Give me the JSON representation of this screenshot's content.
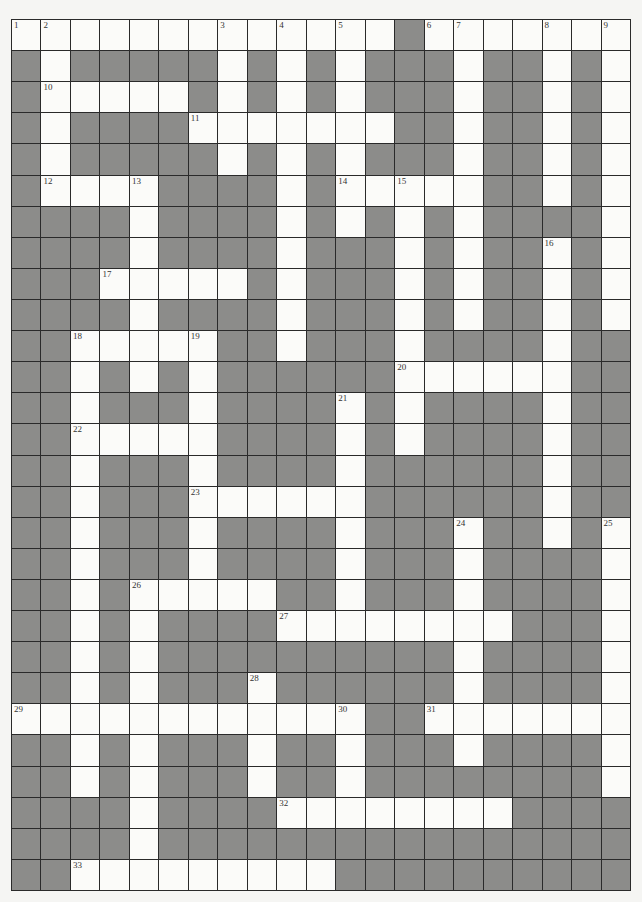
{
  "puzzle": {
    "type": "crossword",
    "cols": 21,
    "rows": 28,
    "colors": {
      "white_cell": "#fbfbf9",
      "block_cell": "#8c8c8a",
      "grid_line": "#2a2a2a",
      "background": "#f5f5f3"
    },
    "white_cells_by_row": [
      [
        0,
        1,
        2,
        3,
        4,
        5,
        6,
        7,
        8,
        9,
        10,
        11,
        12,
        14,
        15,
        16,
        17,
        18,
        19,
        20
      ],
      [
        1,
        7,
        9,
        11,
        15,
        18,
        20
      ],
      [
        1,
        2,
        3,
        4,
        5,
        7,
        9,
        11,
        15,
        18,
        20
      ],
      [
        1,
        6,
        7,
        8,
        9,
        10,
        11,
        12,
        15,
        18,
        20
      ],
      [
        1,
        7,
        9,
        11,
        15,
        18,
        20
      ],
      [
        1,
        2,
        3,
        4,
        9,
        11,
        12,
        13,
        14,
        15,
        18,
        20
      ],
      [
        4,
        9,
        11,
        13,
        15,
        20
      ],
      [
        4,
        9,
        13,
        15,
        18,
        20
      ],
      [
        3,
        4,
        5,
        6,
        7,
        9,
        13,
        15,
        18,
        20
      ],
      [
        4,
        9,
        13,
        15,
        18,
        20
      ],
      [
        2,
        3,
        4,
        5,
        6,
        9,
        13,
        18
      ],
      [
        2,
        4,
        6,
        13,
        14,
        15,
        16,
        17,
        18
      ],
      [
        2,
        6,
        11,
        13,
        18
      ],
      [
        2,
        3,
        4,
        5,
        6,
        11,
        13,
        18
      ],
      [
        2,
        6,
        11,
        18
      ],
      [
        2,
        6,
        7,
        8,
        9,
        10,
        11,
        18
      ],
      [
        2,
        6,
        11,
        15,
        18,
        20
      ],
      [
        2,
        6,
        11,
        15,
        20
      ],
      [
        2,
        4,
        5,
        6,
        7,
        8,
        11,
        15,
        20
      ],
      [
        2,
        4,
        9,
        10,
        11,
        12,
        13,
        14,
        15,
        16,
        20
      ],
      [
        2,
        4,
        15,
        20
      ],
      [
        2,
        4,
        8,
        15,
        20
      ],
      [
        0,
        1,
        2,
        3,
        4,
        5,
        6,
        7,
        8,
        9,
        10,
        11,
        14,
        15,
        16,
        17,
        18,
        19,
        20
      ],
      [
        2,
        4,
        8,
        11,
        15,
        20
      ],
      [
        2,
        4,
        8,
        11,
        20
      ],
      [
        4,
        9,
        10,
        11,
        12,
        13,
        14,
        15,
        16
      ],
      [
        4
      ],
      [
        2,
        3,
        4,
        5,
        6,
        7,
        8,
        9,
        10
      ]
    ],
    "numbers": [
      {
        "n": "1",
        "row": 0,
        "col": 0
      },
      {
        "n": "2",
        "row": 0,
        "col": 1
      },
      {
        "n": "3",
        "row": 0,
        "col": 7
      },
      {
        "n": "4",
        "row": 0,
        "col": 9
      },
      {
        "n": "5",
        "row": 0,
        "col": 11
      },
      {
        "n": "6",
        "row": 0,
        "col": 14
      },
      {
        "n": "7",
        "row": 0,
        "col": 15
      },
      {
        "n": "8",
        "row": 0,
        "col": 18
      },
      {
        "n": "9",
        "row": 0,
        "col": 20
      },
      {
        "n": "10",
        "row": 2,
        "col": 1
      },
      {
        "n": "11",
        "row": 3,
        "col": 6
      },
      {
        "n": "12",
        "row": 5,
        "col": 1
      },
      {
        "n": "13",
        "row": 5,
        "col": 4
      },
      {
        "n": "14",
        "row": 5,
        "col": 11
      },
      {
        "n": "15",
        "row": 5,
        "col": 13
      },
      {
        "n": "16",
        "row": 7,
        "col": 18
      },
      {
        "n": "17",
        "row": 8,
        "col": 3
      },
      {
        "n": "18",
        "row": 10,
        "col": 2
      },
      {
        "n": "19",
        "row": 10,
        "col": 6
      },
      {
        "n": "20",
        "row": 11,
        "col": 13
      },
      {
        "n": "21",
        "row": 12,
        "col": 11
      },
      {
        "n": "22",
        "row": 13,
        "col": 2
      },
      {
        "n": "23",
        "row": 15,
        "col": 6
      },
      {
        "n": "24",
        "row": 16,
        "col": 15
      },
      {
        "n": "25",
        "row": 16,
        "col": 20
      },
      {
        "n": "26",
        "row": 18,
        "col": 4
      },
      {
        "n": "27",
        "row": 19,
        "col": 9
      },
      {
        "n": "28",
        "row": 21,
        "col": 8
      },
      {
        "n": "29",
        "row": 22,
        "col": 0
      },
      {
        "n": "30",
        "row": 22,
        "col": 11
      },
      {
        "n": "31",
        "row": 22,
        "col": 14
      },
      {
        "n": "32",
        "row": 25,
        "col": 9
      },
      {
        "n": "33",
        "row": 27,
        "col": 2
      }
    ]
  }
}
